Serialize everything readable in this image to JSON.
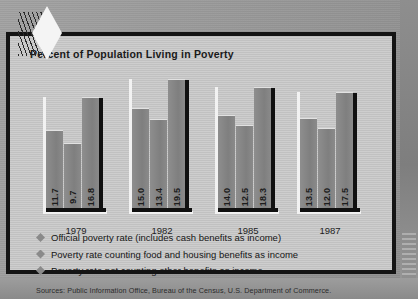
{
  "slide": {
    "title": "Percent of Population Living in Poverty",
    "ornament_icon": "diamond-ornament-icon",
    "source": "Sources: Public Information Office, Bureau of the Census, U.S. Department of Commerce."
  },
  "legend": [
    {
      "marker_icon": "diamond-bullet-icon",
      "label": "Official poverty rate (includes cash benefits as income)"
    },
    {
      "marker_icon": "diamond-bullet-icon",
      "label": "Poverty rate counting food and housing benefits as income"
    },
    {
      "marker_icon": "diamond-bullet-icon",
      "label": "Poverty rate not counting other benefits as income"
    }
  ],
  "colors": {
    "frame": "#141414",
    "slide_background": "#cbcbcb",
    "bar_fill": "#858585",
    "bar_shadow": "#101010",
    "bar_highlight": "#f2f2f2",
    "text": "#151515",
    "photo_background": "#9b9b9b"
  },
  "chart_data": {
    "type": "bar",
    "title": "Percent of Population Living in Poverty",
    "xlabel": "",
    "ylabel": "",
    "ylim": [
      0,
      21
    ],
    "grid": false,
    "legend_position": "below",
    "categories": [
      "1979",
      "1982",
      "1985",
      "1987"
    ],
    "series": [
      {
        "name": "Official poverty rate (includes cash benefits as income)",
        "values": [
          11.7,
          15.0,
          14.0,
          13.5
        ],
        "labels": [
          "11.7",
          "15.0",
          "14.0",
          "13.5"
        ]
      },
      {
        "name": "Poverty rate counting food and housing benefits as income",
        "values": [
          9.7,
          13.4,
          12.5,
          12.0
        ],
        "labels": [
          "9.7",
          "13.4",
          "12.5",
          "12.0"
        ]
      },
      {
        "name": "Poverty rate not counting other benefits as income",
        "values": [
          16.8,
          19.5,
          18.3,
          17.5
        ],
        "labels": [
          "16.8",
          "19.5",
          "18.3",
          "17.5"
        ]
      }
    ]
  }
}
